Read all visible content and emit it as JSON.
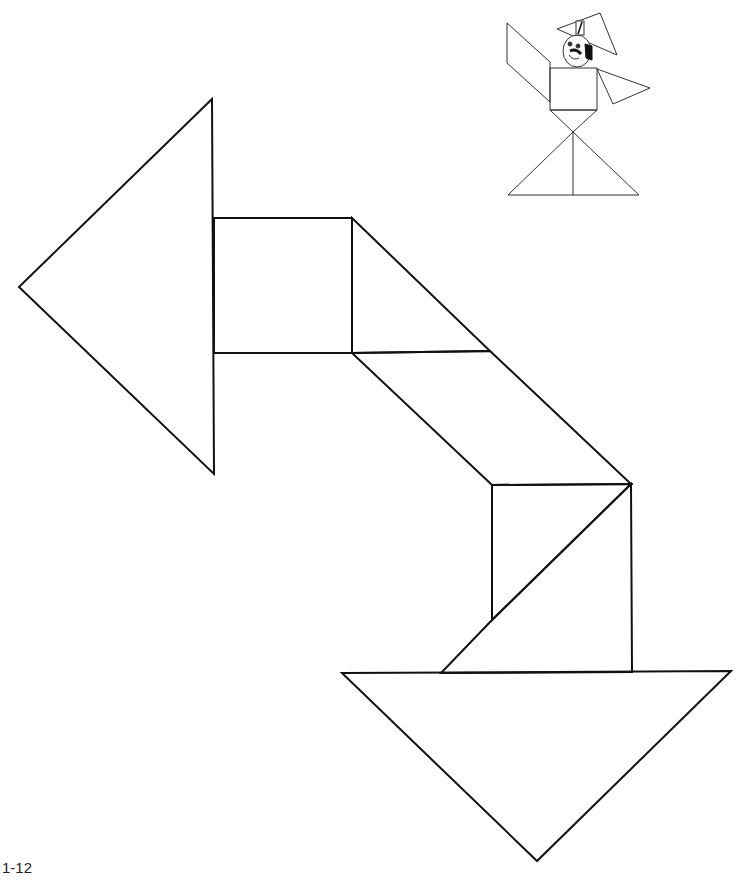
{
  "page": {
    "label": "1-12",
    "background": "#ffffff",
    "stroke_color": "#111111"
  },
  "puzzle": {
    "title": "Tangram arrow",
    "pieces": [
      {
        "name": "large-triangle-left",
        "points": "212,99 19,287 214,474"
      },
      {
        "name": "square-top",
        "points": "214,218 352,218 352,353 214,353"
      },
      {
        "name": "small-triangle-top",
        "points": "352,218 490,351 352,353"
      },
      {
        "name": "parallelogram-middle",
        "points": "352,353 490,351 631,484 492,485"
      },
      {
        "name": "medium-square-lower",
        "points": "492,485 631,484 492,620"
      },
      {
        "name": "triangle-lower-right",
        "points": "631,484 632,672 441,673"
      },
      {
        "name": "large-triangle-bottom",
        "points": "342,673 731,671 537,861"
      }
    ]
  }
}
